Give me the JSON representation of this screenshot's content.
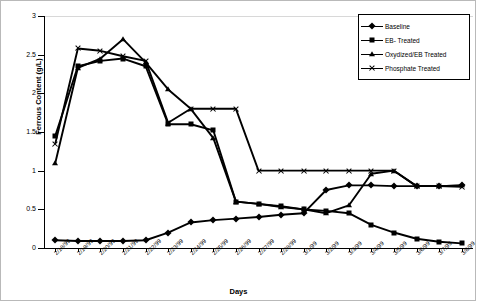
{
  "chart_data": {
    "type": "line",
    "title": "",
    "xlabel": "Days",
    "ylabel": "Ferrous Content (g/L)",
    "ylim": [
      0,
      3
    ],
    "ytick_labels": [
      "0",
      "0.5",
      "1",
      "1.5",
      "2",
      "2.5",
      "3"
    ],
    "ytick_values": [
      0,
      0.5,
      1,
      1.5,
      2,
      2.5,
      3
    ],
    "grid": false,
    "legend_position": "top-right",
    "categories": [
      "2/18/99",
      "2/19/99",
      "2/20/99",
      "2/21/99",
      "2/22/99",
      "2/23/99",
      "2/24/99",
      "2/25/99",
      "2/26/99",
      "2/27/99",
      "2/28/99",
      "3/1/99",
      "3/2/99",
      "3/3/99",
      "3/4/99",
      "3/5/99",
      "3/6/99",
      "3/7/99",
      "3/8/99"
    ],
    "series": [
      {
        "name": "Baseline",
        "marker": "diamond",
        "values": [
          0.1,
          0.09,
          0.09,
          0.09,
          0.1,
          0.2,
          0.33,
          0.36,
          0.38,
          0.4,
          0.43,
          0.45,
          0.75,
          0.81,
          0.81,
          0.8,
          0.8,
          0.8,
          0.81
        ]
      },
      {
        "name": "EB- Treated",
        "marker": "square",
        "values": [
          1.45,
          2.35,
          2.42,
          2.45,
          2.35,
          1.6,
          1.6,
          1.52,
          0.6,
          0.57,
          0.54,
          0.5,
          0.48,
          0.45,
          0.3,
          0.2,
          0.12,
          0.08,
          0.06
        ]
      },
      {
        "name": "Oxydized/EB Treated",
        "marker": "triangle",
        "values": [
          1.1,
          2.33,
          2.45,
          2.7,
          2.4,
          2.05,
          1.8,
          1.42,
          0.6,
          0.57,
          0.53,
          0.5,
          0.45,
          0.55,
          0.96,
          1.0,
          0.8,
          0.8,
          0.81
        ]
      },
      {
        "name": "Phosphate Treated",
        "marker": "cross",
        "values": [
          1.35,
          2.58,
          2.55,
          2.48,
          2.42,
          1.62,
          1.8,
          1.8,
          1.8,
          1.0,
          1.0,
          1.0,
          1.0,
          1.0,
          1.0,
          1.0,
          0.8,
          0.8,
          0.79
        ]
      }
    ]
  },
  "legend": {
    "items": [
      {
        "label": "Baseline",
        "marker": "diamond"
      },
      {
        "label": "EB- Treated",
        "marker": "square"
      },
      {
        "label": "Oxydized/EB Treated",
        "marker": "triangle"
      },
      {
        "label": "Phosphate Treated",
        "marker": "cross"
      }
    ]
  }
}
